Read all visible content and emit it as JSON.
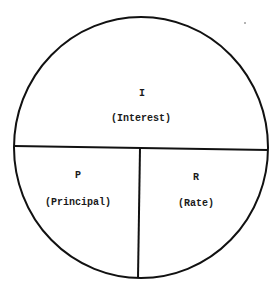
{
  "diagram": {
    "type": "interest-formula-circle",
    "shape": "circle",
    "sections": [
      {
        "id": "interest",
        "letter": "I",
        "name": "(Interest)",
        "position": "top"
      },
      {
        "id": "principal",
        "letter": "P",
        "name": "(Principal)",
        "position": "bottom-left"
      },
      {
        "id": "rate",
        "letter": "R",
        "name": "(Rate)",
        "position": "bottom-right"
      }
    ],
    "colors": {
      "line": "#111111",
      "background": "#ffffff",
      "text": "#1a1a1a"
    }
  }
}
